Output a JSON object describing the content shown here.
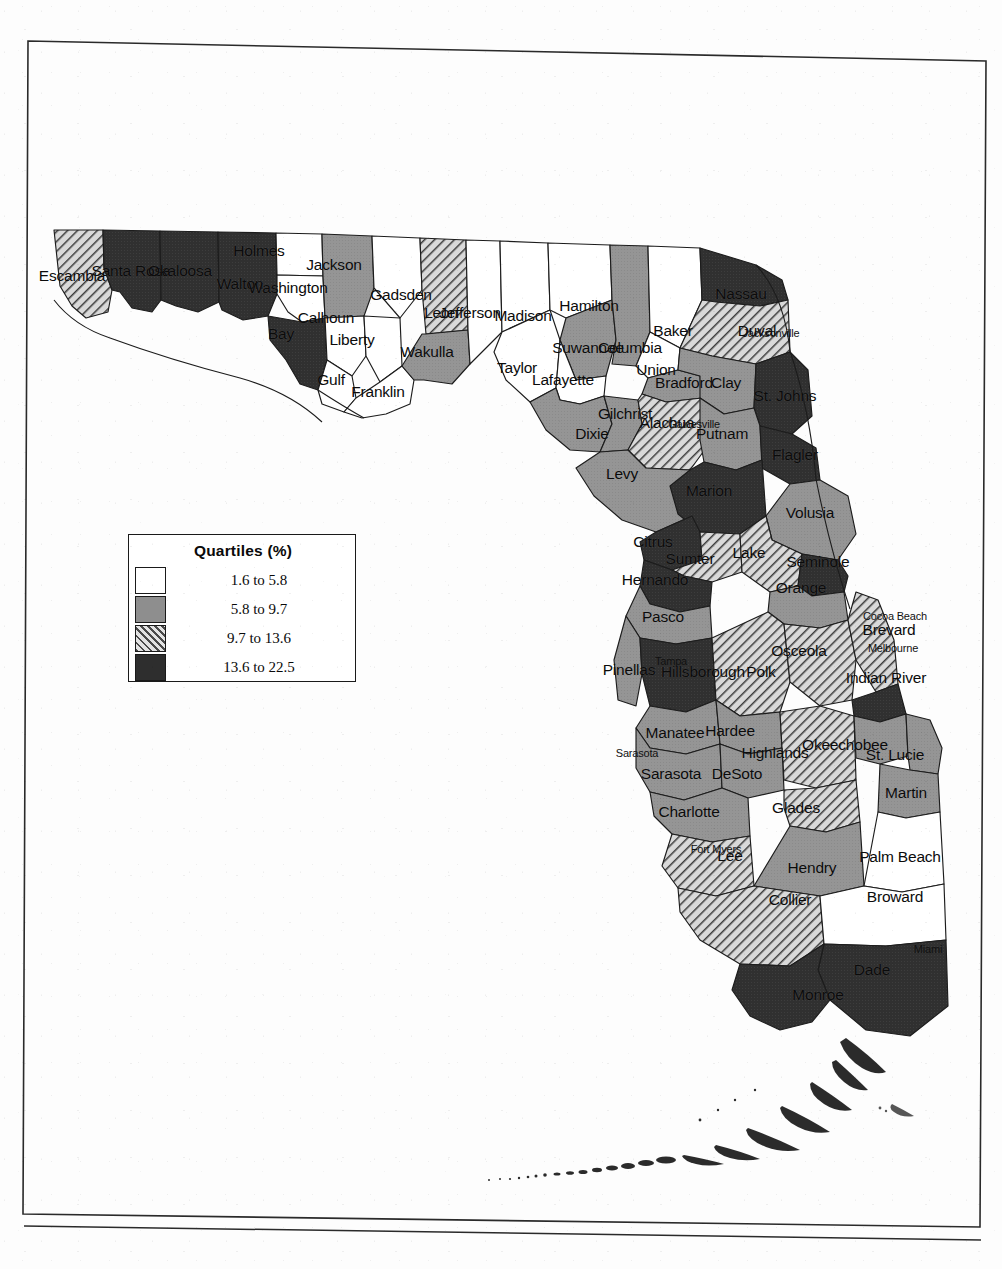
{
  "document": {
    "type": "scanned-page",
    "page_frame": true,
    "footer_rule": true
  },
  "legend": {
    "title": "Quartiles (%)",
    "entries": [
      {
        "swatch": "q1",
        "label": "1.6 to 5.8",
        "pattern": "white",
        "color": "#ffffff"
      },
      {
        "swatch": "q2",
        "label": "5.8 to 9.7",
        "pattern": "solid-gray",
        "color": "#8e8e8e"
      },
      {
        "swatch": "q3",
        "label": "9.7 to 13.6",
        "pattern": "diagonal-hatch",
        "color": "#b9b9b9"
      },
      {
        "swatch": "q4",
        "label": "13.6 to 22.5",
        "pattern": "solid-dark",
        "color": "#2e2e2e"
      }
    ]
  },
  "chart_data": {
    "type": "map",
    "subtype": "choropleth",
    "title": "Quartiles (%)",
    "region": "Florida",
    "unit": "%",
    "classes": 4,
    "class_breaks": [
      1.6,
      5.8,
      9.7,
      13.6,
      22.5
    ],
    "class_labels": [
      "1.6 to 5.8",
      "5.8 to 9.7",
      "9.7 to 13.6",
      "13.6 to 22.5"
    ],
    "counties": [
      {
        "name": "Escambia",
        "quartile": 3
      },
      {
        "name": "Santa Rosa",
        "quartile": 4
      },
      {
        "name": "Okaloosa",
        "quartile": 4
      },
      {
        "name": "Walton",
        "quartile": 4
      },
      {
        "name": "Holmes",
        "quartile": 1
      },
      {
        "name": "Washington",
        "quartile": 1
      },
      {
        "name": "Jackson",
        "quartile": 2
      },
      {
        "name": "Bay",
        "quartile": 4
      },
      {
        "name": "Calhoun",
        "quartile": 1
      },
      {
        "name": "Gulf",
        "quartile": 1
      },
      {
        "name": "Liberty",
        "quartile": 1
      },
      {
        "name": "Franklin",
        "quartile": 1
      },
      {
        "name": "Gadsden",
        "quartile": 1
      },
      {
        "name": "Leon",
        "quartile": 3
      },
      {
        "name": "Wakulla",
        "quartile": 2
      },
      {
        "name": "Jefferson",
        "quartile": 1
      },
      {
        "name": "Madison",
        "quartile": 1
      },
      {
        "name": "Taylor",
        "quartile": 1
      },
      {
        "name": "Hamilton",
        "quartile": 1
      },
      {
        "name": "Suwannee",
        "quartile": 2
      },
      {
        "name": "Lafayette",
        "quartile": 1
      },
      {
        "name": "Dixie",
        "quartile": 2
      },
      {
        "name": "Columbia",
        "quartile": 2
      },
      {
        "name": "Baker",
        "quartile": 1
      },
      {
        "name": "Union",
        "quartile": 1
      },
      {
        "name": "Bradford",
        "quartile": 2
      },
      {
        "name": "Gilchrist",
        "quartile": 2
      },
      {
        "name": "Alachua",
        "quartile": 3
      },
      {
        "name": "Levy",
        "quartile": 2
      },
      {
        "name": "Nassau",
        "quartile": 4
      },
      {
        "name": "Duval",
        "quartile": 3
      },
      {
        "name": "Clay",
        "quartile": 2
      },
      {
        "name": "St. Johns",
        "quartile": 4
      },
      {
        "name": "Putnam",
        "quartile": 2
      },
      {
        "name": "Flagler",
        "quartile": 4
      },
      {
        "name": "Marion",
        "quartile": 4
      },
      {
        "name": "Volusia",
        "quartile": 2
      },
      {
        "name": "Citrus",
        "quartile": 4
      },
      {
        "name": "Sumter",
        "quartile": 3
      },
      {
        "name": "Lake",
        "quartile": 3
      },
      {
        "name": "Seminole",
        "quartile": 4
      },
      {
        "name": "Orange",
        "quartile": 2
      },
      {
        "name": "Hernando",
        "quartile": 4
      },
      {
        "name": "Pasco",
        "quartile": 2
      },
      {
        "name": "Pinellas",
        "quartile": 2
      },
      {
        "name": "Hillsborough",
        "quartile": 4
      },
      {
        "name": "Polk",
        "quartile": 3
      },
      {
        "name": "Osceola",
        "quartile": 3
      },
      {
        "name": "Brevard",
        "quartile": 3
      },
      {
        "name": "Indian River",
        "quartile": 4
      },
      {
        "name": "Manatee",
        "quartile": 2
      },
      {
        "name": "Hardee",
        "quartile": 2
      },
      {
        "name": "Highlands",
        "quartile": 3
      },
      {
        "name": "Okeechobee",
        "quartile": 2
      },
      {
        "name": "St. Lucie",
        "quartile": 2
      },
      {
        "name": "Sarasota",
        "quartile": 2
      },
      {
        "name": "DeSoto",
        "quartile": 2
      },
      {
        "name": "Charlotte",
        "quartile": 2
      },
      {
        "name": "Glades",
        "quartile": 3
      },
      {
        "name": "Martin",
        "quartile": 2
      },
      {
        "name": "Lee",
        "quartile": 3
      },
      {
        "name": "Hendry",
        "quartile": 2
      },
      {
        "name": "Palm Beach",
        "quartile": 1
      },
      {
        "name": "Collier",
        "quartile": 3
      },
      {
        "name": "Broward",
        "quartile": 1
      },
      {
        "name": "Dade",
        "quartile": 4
      },
      {
        "name": "Monroe",
        "quartile": 4
      }
    ],
    "cities": [
      {
        "name": "Jacksonville"
      },
      {
        "name": "Gainesville"
      },
      {
        "name": "Tampa"
      },
      {
        "name": "Sarasota"
      },
      {
        "name": "Fort Myers"
      },
      {
        "name": "Cocoa Beach"
      },
      {
        "name": "Melbourne"
      },
      {
        "name": "Miami"
      }
    ]
  },
  "labels": {
    "counties": [
      {
        "text": "Escambia",
        "x": 72,
        "y": 276
      },
      {
        "text": "Santa Rosa",
        "x": 131,
        "y": 271
      },
      {
        "text": "Okaloosa",
        "x": 180,
        "y": 271
      },
      {
        "text": "Walton",
        "x": 240,
        "y": 284
      },
      {
        "text": "Holmes",
        "x": 259,
        "y": 251
      },
      {
        "text": "Washington",
        "x": 288,
        "y": 288
      },
      {
        "text": "Jackson",
        "x": 334,
        "y": 265
      },
      {
        "text": "Bay",
        "x": 281,
        "y": 334
      },
      {
        "text": "Calhoun",
        "x": 326,
        "y": 318
      },
      {
        "text": "Gulf",
        "x": 331,
        "y": 380
      },
      {
        "text": "Liberty",
        "x": 352,
        "y": 340
      },
      {
        "text": "Franklin",
        "x": 378,
        "y": 392
      },
      {
        "text": "Gadsden",
        "x": 401,
        "y": 295
      },
      {
        "text": "Leon",
        "x": 441,
        "y": 313
      },
      {
        "text": "Wakulla",
        "x": 427,
        "y": 352
      },
      {
        "text": "Jefferson",
        "x": 470,
        "y": 313
      },
      {
        "text": "Madison",
        "x": 523,
        "y": 316
      },
      {
        "text": "Taylor",
        "x": 517,
        "y": 368
      },
      {
        "text": "Hamilton",
        "x": 589,
        "y": 306
      },
      {
        "text": "Suwannee",
        "x": 588,
        "y": 348
      },
      {
        "text": "Lafayette",
        "x": 563,
        "y": 380
      },
      {
        "text": "Dixie",
        "x": 592,
        "y": 434
      },
      {
        "text": "Columbia",
        "x": 630,
        "y": 348
      },
      {
        "text": "Baker",
        "x": 673,
        "y": 331
      },
      {
        "text": "Union",
        "x": 656,
        "y": 370
      },
      {
        "text": "Bradford",
        "x": 684,
        "y": 383
      },
      {
        "text": "Gilchrist",
        "x": 625,
        "y": 414
      },
      {
        "text": "Alachua",
        "x": 667,
        "y": 423
      },
      {
        "text": "Levy",
        "x": 622,
        "y": 474
      },
      {
        "text": "Nassau",
        "x": 741,
        "y": 294
      },
      {
        "text": "Duval",
        "x": 757,
        "y": 331
      },
      {
        "text": "Clay",
        "x": 726,
        "y": 383
      },
      {
        "text": "St. Johns",
        "x": 785,
        "y": 396
      },
      {
        "text": "Putnam",
        "x": 722,
        "y": 434
      },
      {
        "text": "Flagler",
        "x": 795,
        "y": 455
      },
      {
        "text": "Marion",
        "x": 709,
        "y": 491
      },
      {
        "text": "Volusia",
        "x": 810,
        "y": 513
      },
      {
        "text": "Citrus",
        "x": 653,
        "y": 542
      },
      {
        "text": "Sumter",
        "x": 690,
        "y": 559
      },
      {
        "text": "Lake",
        "x": 749,
        "y": 553
      },
      {
        "text": "Seminole",
        "x": 818,
        "y": 562
      },
      {
        "text": "Orange",
        "x": 801,
        "y": 588
      },
      {
        "text": "Hernando",
        "x": 655,
        "y": 580
      },
      {
        "text": "Pasco",
        "x": 663,
        "y": 617
      },
      {
        "text": "Pinellas",
        "x": 629,
        "y": 670
      },
      {
        "text": "Hillsborough",
        "x": 703,
        "y": 672
      },
      {
        "text": "Polk",
        "x": 761,
        "y": 672
      },
      {
        "text": "Osceola",
        "x": 799,
        "y": 651
      },
      {
        "text": "Brevard",
        "x": 889,
        "y": 630
      },
      {
        "text": "Indian River",
        "x": 886,
        "y": 678
      },
      {
        "text": "Manatee",
        "x": 675,
        "y": 733
      },
      {
        "text": "Hardee",
        "x": 730,
        "y": 731
      },
      {
        "text": "Highlands",
        "x": 775,
        "y": 753
      },
      {
        "text": "Okeechobee",
        "x": 845,
        "y": 745
      },
      {
        "text": "St. Lucie",
        "x": 895,
        "y": 755
      },
      {
        "text": "Sarasota",
        "x": 671,
        "y": 774
      },
      {
        "text": "DeSoto",
        "x": 737,
        "y": 774
      },
      {
        "text": "Charlotte",
        "x": 689,
        "y": 812
      },
      {
        "text": "Glades",
        "x": 796,
        "y": 808
      },
      {
        "text": "Martin",
        "x": 906,
        "y": 793
      },
      {
        "text": "Lee",
        "x": 730,
        "y": 856
      },
      {
        "text": "Hendry",
        "x": 812,
        "y": 868
      },
      {
        "text": "Palm Beach",
        "x": 900,
        "y": 857
      },
      {
        "text": "Collier",
        "x": 790,
        "y": 900
      },
      {
        "text": "Broward",
        "x": 895,
        "y": 897
      },
      {
        "text": "Dade",
        "x": 872,
        "y": 970
      },
      {
        "text": "Monroe",
        "x": 818,
        "y": 995
      }
    ],
    "cities": [
      {
        "text": "Jacksonville",
        "x": 771,
        "y": 333
      },
      {
        "text": "Gainesville",
        "x": 694,
        "y": 424
      },
      {
        "text": "Tampa",
        "x": 671,
        "y": 661
      },
      {
        "text": "Sarasota",
        "x": 637,
        "y": 753
      },
      {
        "text": "Fort Myers",
        "x": 716,
        "y": 849
      },
      {
        "text": "Cocoa Beach",
        "x": 895,
        "y": 616
      },
      {
        "text": "Melbourne",
        "x": 893,
        "y": 648
      },
      {
        "text": "Miami",
        "x": 928,
        "y": 949
      }
    ]
  }
}
